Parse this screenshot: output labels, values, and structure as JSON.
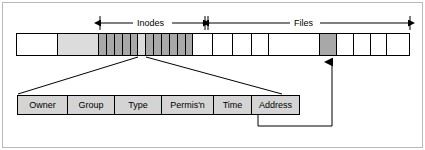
{
  "figure": {
    "background": "#ffffff",
    "frame_color": "#b9b9b9"
  },
  "colors": {
    "white_block": "#ffffff",
    "light_gray_block": "#dcdcdc",
    "dark_gray_block": "#a8a8a8",
    "table_fill": "#d4d4d4",
    "stroke": "#000000"
  },
  "span_labels": {
    "inodes": "Inodes",
    "files": "Files"
  },
  "disk_bar": {
    "cells": [
      {
        "name": "boot-block",
        "fill": "white",
        "width": 42
      },
      {
        "name": "super-block",
        "fill": "light",
        "width": 42
      },
      {
        "name": "inode-1",
        "fill": "dark",
        "width": 8
      },
      {
        "name": "inode-2",
        "fill": "dark",
        "width": 8
      },
      {
        "name": "inode-3",
        "fill": "dark",
        "width": 8
      },
      {
        "name": "inode-4",
        "fill": "dark",
        "width": 8
      },
      {
        "name": "inode-5",
        "fill": "dark",
        "width": 8
      },
      {
        "name": "inode-6-selected",
        "fill": "light",
        "width": 8
      },
      {
        "name": "inode-7",
        "fill": "dark",
        "width": 8
      },
      {
        "name": "inode-8",
        "fill": "dark",
        "width": 8
      },
      {
        "name": "inode-9",
        "fill": "dark",
        "width": 8
      },
      {
        "name": "inode-10",
        "fill": "dark",
        "width": 8
      },
      {
        "name": "inode-11",
        "fill": "dark",
        "width": 8
      },
      {
        "name": "inode-12",
        "fill": "dark",
        "width": 8
      },
      {
        "name": "file-block-1",
        "fill": "white",
        "width": 20
      },
      {
        "name": "file-block-2",
        "fill": "white",
        "width": 20
      },
      {
        "name": "file-block-3",
        "fill": "white",
        "width": 20
      },
      {
        "name": "file-block-4",
        "fill": "white",
        "width": 17
      },
      {
        "name": "file-block-5",
        "fill": "white",
        "width": 52
      },
      {
        "name": "file-block-6-target",
        "fill": "dark",
        "width": 18
      },
      {
        "name": "file-block-7",
        "fill": "white",
        "width": 17
      },
      {
        "name": "file-block-8",
        "fill": "white",
        "width": 17
      },
      {
        "name": "file-block-9",
        "fill": "white",
        "width": 17
      },
      {
        "name": "file-block-10",
        "fill": "white",
        "width": 22
      }
    ]
  },
  "inode_fields": [
    {
      "name": "owner",
      "label": "Owner",
      "width": 50
    },
    {
      "name": "group",
      "label": "Group",
      "width": 47
    },
    {
      "name": "type",
      "label": "Type",
      "width": 47
    },
    {
      "name": "permissions",
      "label": "Permis'n",
      "width": 52
    },
    {
      "name": "time",
      "label": "Time",
      "width": 38
    },
    {
      "name": "address",
      "label": "Address",
      "width": 47
    }
  ]
}
